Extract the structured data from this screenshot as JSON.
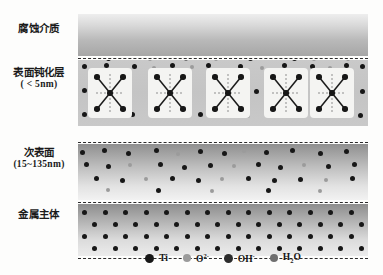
{
  "diagram": {
    "layers": [
      {
        "key": "medium",
        "label_line1": "腐蚀介质",
        "label_line2": "",
        "top": 0,
        "height": 42
      },
      {
        "key": "passive",
        "label_line1": "表面钝化层",
        "label_line2": "( < 5nm)",
        "top": 46,
        "height": 66
      },
      {
        "key": "subsurface",
        "label_line1": "次表面",
        "label_line2": "(15~135nm)",
        "top": 130,
        "height": 56
      },
      {
        "key": "metal",
        "label_line1": "金属主体",
        "label_line2": "",
        "top": 190,
        "height": 52
      }
    ],
    "separators_y": [
      44,
      128,
      188,
      244
    ],
    "frame": {
      "left": 78,
      "top": 14,
      "width": 290,
      "height": 232
    }
  },
  "legend": {
    "items": [
      {
        "name": "Ti",
        "html_label": "Ti",
        "color": "#171717",
        "swatch_size": 9
      },
      {
        "name": "O2-",
        "html_label": "O",
        "sup": "2-",
        "color": "#9b9b9b",
        "swatch_size": 8
      },
      {
        "name": "OH-",
        "html_label": "OH",
        "sup": "-",
        "color": "#2c2c2c",
        "swatch_size": 9
      },
      {
        "name": "H2O",
        "html_label": "H",
        "sub": "2",
        "tail": "O",
        "color": "#6f6f6f",
        "swatch_size": 8
      }
    ]
  },
  "colors": {
    "ti": "#171717",
    "o2": "#9b9b9b",
    "oh": "#2c2c2c",
    "h2o": "#6f6f6f",
    "separator": "#2b2b2b",
    "xbox_fill": "#f4f4f2",
    "background": "#fdfdfc"
  },
  "chart_data": {
    "type": "diagram",
    "particles": {
      "medium_interface": [
        {
          "t": "ti",
          "x": 6,
          "y": -5,
          "s": 5.4
        },
        {
          "t": "ti",
          "x": 28,
          "y": -4,
          "s": 5.2
        },
        {
          "t": "ti",
          "x": 50,
          "y": -5,
          "s": 5.0
        },
        {
          "t": "o2",
          "x": 70,
          "y": -3,
          "s": 4.2
        },
        {
          "t": "ti",
          "x": 88,
          "y": -5,
          "s": 5.4
        },
        {
          "t": "h2o",
          "x": 106,
          "y": -3,
          "s": 4.0
        },
        {
          "t": "ti",
          "x": 118,
          "y": -5,
          "s": 5.2
        },
        {
          "t": "o2",
          "x": 136,
          "y": -3,
          "s": 4.2
        },
        {
          "t": "ti",
          "x": 152,
          "y": -5,
          "s": 5.4
        },
        {
          "t": "ti",
          "x": 170,
          "y": -4,
          "s": 5.2
        },
        {
          "t": "ti",
          "x": 192,
          "y": -5,
          "s": 5.4
        },
        {
          "t": "ti",
          "x": 214,
          "y": -4,
          "s": 5.0
        },
        {
          "t": "o2",
          "x": 234,
          "y": -3,
          "s": 4.0
        },
        {
          "t": "ti",
          "x": 252,
          "y": -5,
          "s": 5.2
        },
        {
          "t": "o2",
          "x": 268,
          "y": -3,
          "s": 4.0
        },
        {
          "t": "ti",
          "x": 282,
          "y": -5,
          "s": 5.4
        }
      ],
      "passive_layer": [
        {
          "t": "ti",
          "x": 4,
          "y": 4,
          "s": 5.2
        },
        {
          "t": "ti",
          "x": 26,
          "y": 3,
          "s": 5.0
        },
        {
          "t": "ti",
          "x": 54,
          "y": 4,
          "s": 5.2
        },
        {
          "t": "o2",
          "x": 74,
          "y": 6,
          "s": 4.0
        },
        {
          "t": "ti",
          "x": 92,
          "y": 3,
          "s": 5.2
        },
        {
          "t": "o2",
          "x": 112,
          "y": 5,
          "s": 4.0
        },
        {
          "t": "ti",
          "x": 128,
          "y": 3,
          "s": 5.2
        },
        {
          "t": "ti",
          "x": 160,
          "y": 4,
          "s": 5.2
        },
        {
          "t": "o2",
          "x": 182,
          "y": 6,
          "s": 4.0
        },
        {
          "t": "ti",
          "x": 204,
          "y": 3,
          "s": 5.2
        },
        {
          "t": "ti",
          "x": 232,
          "y": 4,
          "s": 5.0
        },
        {
          "t": "o2",
          "x": 250,
          "y": 6,
          "s": 4.0
        },
        {
          "t": "ti",
          "x": 266,
          "y": 3,
          "s": 5.2
        },
        {
          "t": "ti",
          "x": 282,
          "y": 4,
          "s": 5.2
        },
        {
          "t": "ti",
          "x": 4,
          "y": 28,
          "s": 5.0
        },
        {
          "t": "o2",
          "x": 24,
          "y": 30,
          "s": 4.0
        },
        {
          "t": "ti",
          "x": 48,
          "y": 29,
          "s": 5.0
        },
        {
          "t": "o2",
          "x": 74,
          "y": 31,
          "s": 4.0
        },
        {
          "t": "o2",
          "x": 136,
          "y": 30,
          "s": 4.0
        },
        {
          "t": "ti",
          "x": 176,
          "y": 29,
          "s": 5.0
        },
        {
          "t": "o2",
          "x": 198,
          "y": 31,
          "s": 4.0
        },
        {
          "t": "o2",
          "x": 244,
          "y": 30,
          "s": 4.0
        },
        {
          "t": "ti",
          "x": 282,
          "y": 29,
          "s": 5.0
        },
        {
          "t": "ti",
          "x": 4,
          "y": 52,
          "s": 5.2
        },
        {
          "t": "ti",
          "x": 26,
          "y": 53,
          "s": 5.0
        },
        {
          "t": "ti",
          "x": 52,
          "y": 52,
          "s": 5.2
        },
        {
          "t": "ti",
          "x": 78,
          "y": 53,
          "s": 5.0
        },
        {
          "t": "o2",
          "x": 100,
          "y": 54,
          "s": 4.0
        },
        {
          "t": "ti",
          "x": 120,
          "y": 52,
          "s": 5.2
        },
        {
          "t": "ti",
          "x": 146,
          "y": 53,
          "s": 5.0
        },
        {
          "t": "o2",
          "x": 168,
          "y": 54,
          "s": 4.0
        },
        {
          "t": "ti",
          "x": 188,
          "y": 52,
          "s": 5.2
        },
        {
          "t": "ti",
          "x": 212,
          "y": 53,
          "s": 5.0
        },
        {
          "t": "o2",
          "x": 236,
          "y": 54,
          "s": 4.0
        },
        {
          "t": "ti",
          "x": 258,
          "y": 52,
          "s": 5.2
        },
        {
          "t": "ti",
          "x": 280,
          "y": 53,
          "s": 5.0
        }
      ],
      "subsurface": [
        {
          "t": "ti",
          "x": 2,
          "y": 6,
          "s": 5.2
        },
        {
          "t": "ti",
          "x": 24,
          "y": 4,
          "s": 5.2
        },
        {
          "t": "ti",
          "x": 48,
          "y": 7,
          "s": 5.0
        },
        {
          "t": "ti",
          "x": 76,
          "y": 4,
          "s": 5.2
        },
        {
          "t": "o2",
          "x": 98,
          "y": 8,
          "s": 4.0
        },
        {
          "t": "ti",
          "x": 120,
          "y": 5,
          "s": 5.2
        },
        {
          "t": "ti",
          "x": 144,
          "y": 7,
          "s": 5.0
        },
        {
          "t": "o2",
          "x": 164,
          "y": 5,
          "s": 4.0
        },
        {
          "t": "ti",
          "x": 186,
          "y": 6,
          "s": 5.2
        },
        {
          "t": "ti",
          "x": 212,
          "y": 4,
          "s": 5.0
        },
        {
          "t": "ti",
          "x": 240,
          "y": 7,
          "s": 5.2
        },
        {
          "t": "ti",
          "x": 266,
          "y": 5,
          "s": 5.0
        },
        {
          "t": "ti",
          "x": 6,
          "y": 18,
          "s": 5.0
        },
        {
          "t": "ti",
          "x": 28,
          "y": 20,
          "s": 5.2
        },
        {
          "t": "o2",
          "x": 50,
          "y": 19,
          "s": 4.0
        },
        {
          "t": "ti",
          "x": 80,
          "y": 18,
          "s": 5.0
        },
        {
          "t": "ti",
          "x": 104,
          "y": 21,
          "s": 5.2
        },
        {
          "t": "ti",
          "x": 130,
          "y": 19,
          "s": 5.0
        },
        {
          "t": "o2",
          "x": 154,
          "y": 20,
          "s": 4.0
        },
        {
          "t": "ti",
          "x": 178,
          "y": 18,
          "s": 5.2
        },
        {
          "t": "ti",
          "x": 200,
          "y": 21,
          "s": 5.0
        },
        {
          "t": "o2",
          "x": 224,
          "y": 19,
          "s": 4.0
        },
        {
          "t": "ti",
          "x": 248,
          "y": 20,
          "s": 5.2
        },
        {
          "t": "ti",
          "x": 274,
          "y": 18,
          "s": 5.0
        },
        {
          "t": "ti",
          "x": 16,
          "y": 32,
          "s": 5.2
        },
        {
          "t": "ti",
          "x": 42,
          "y": 34,
          "s": 5.0
        },
        {
          "t": "o2",
          "x": 66,
          "y": 33,
          "s": 4.0
        },
        {
          "t": "ti",
          "x": 92,
          "y": 32,
          "s": 5.2
        },
        {
          "t": "ti",
          "x": 118,
          "y": 34,
          "s": 5.0
        },
        {
          "t": "o2",
          "x": 142,
          "y": 33,
          "s": 4.0
        },
        {
          "t": "ti",
          "x": 168,
          "y": 32,
          "s": 5.2
        },
        {
          "t": "ti",
          "x": 194,
          "y": 34,
          "s": 5.0
        },
        {
          "t": "ti",
          "x": 220,
          "y": 33,
          "s": 5.2
        },
        {
          "t": "o2",
          "x": 246,
          "y": 34,
          "s": 4.0
        },
        {
          "t": "ti",
          "x": 272,
          "y": 32,
          "s": 5.0
        },
        {
          "t": "o2",
          "x": 28,
          "y": 44,
          "s": 4.0
        },
        {
          "t": "ti",
          "x": 78,
          "y": 44,
          "s": 5.0
        },
        {
          "t": "o2",
          "x": 132,
          "y": 45,
          "s": 4.0
        },
        {
          "t": "ti",
          "x": 188,
          "y": 44,
          "s": 5.0
        },
        {
          "t": "o2",
          "x": 240,
          "y": 45,
          "s": 4.0
        }
      ],
      "metal_lattice_rows": 4,
      "metal_lattice_cols": 14
    }
  }
}
